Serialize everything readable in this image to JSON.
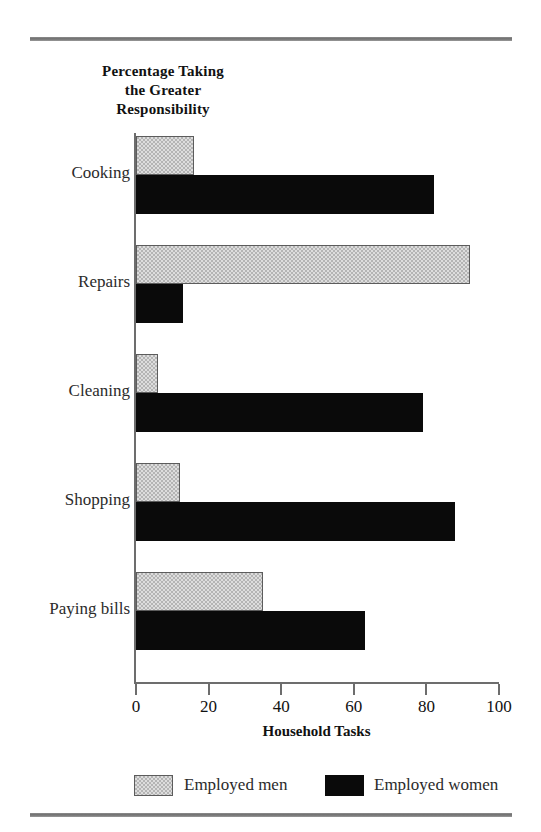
{
  "chart_data": {
    "type": "bar",
    "orientation": "horizontal",
    "title": "Percentage Taking the Greater Responsibility",
    "title_lines": [
      "Percentage Taking",
      "the Greater",
      "Responsibility"
    ],
    "xlabel": "Household Tasks",
    "ylabel": "",
    "categories": [
      "Cooking",
      "Repairs",
      "Cleaning",
      "Shopping",
      "Paying bills"
    ],
    "series": [
      {
        "name": "Employed men",
        "color": "#b4b4b4",
        "values": [
          16,
          92,
          6,
          12,
          35
        ]
      },
      {
        "name": "Employed women",
        "color": "#0a0a0a",
        "values": [
          82,
          13,
          79,
          88,
          63
        ]
      }
    ],
    "xlim": [
      0,
      100
    ],
    "xticks": [
      0,
      20,
      40,
      60,
      80,
      100
    ],
    "xtick_labels": [
      "0",
      "20",
      "40",
      "60",
      "80",
      "100"
    ],
    "grid": false,
    "legend_position": "bottom",
    "legend": [
      {
        "label": "Employed men",
        "swatch": "gray-hatched-swatch"
      },
      {
        "label": "Employed women",
        "swatch": "black-swatch"
      }
    ]
  },
  "decor": {
    "top_rule": "horizontal-rule",
    "bottom_rule": "horizontal-rule"
  }
}
